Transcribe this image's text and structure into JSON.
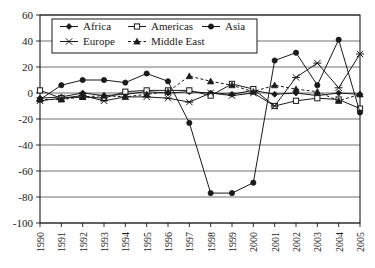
{
  "chart_data": {
    "type": "line",
    "title": "",
    "xlabel": "",
    "ylabel": "",
    "grid": true,
    "legend_position": "top-inside",
    "categories": [
      "1990",
      "1991",
      "1992",
      "1993",
      "1994",
      "1995",
      "1996",
      "1997",
      "1998",
      "1999",
      "2000",
      "2001",
      "2002",
      "2003",
      "2004",
      "2005"
    ],
    "x": [
      1990,
      1991,
      1992,
      1993,
      1994,
      1995,
      1996,
      1997,
      1998,
      1999,
      2000,
      2001,
      2002,
      2003,
      2004,
      2005
    ],
    "xlim": [
      1990,
      2005
    ],
    "ylim": [
      -100,
      60
    ],
    "yticks": [
      60,
      40,
      20,
      0,
      -20,
      -40,
      -60,
      -80,
      -100
    ],
    "series": [
      {
        "name": "Africa",
        "marker": "filled-diamond",
        "line": "solid",
        "color": "#1a1a1a",
        "values": [
          -4,
          -3,
          0,
          -2,
          -1,
          1,
          0,
          1,
          0,
          -1,
          2,
          -1,
          0,
          -2,
          0,
          -1
        ]
      },
      {
        "name": "Americas",
        "marker": "open-square",
        "line": "solid",
        "color": "#1a1a1a",
        "values": [
          2,
          -4,
          -3,
          -4,
          1,
          2,
          2,
          2,
          -2,
          7,
          3,
          -10,
          -6,
          -4,
          -5,
          -12
        ]
      },
      {
        "name": "Asia",
        "marker": "filled-circle",
        "line": "solid",
        "color": "#1a1a1a",
        "values": [
          -5,
          6,
          10,
          10,
          8,
          15,
          9,
          -23,
          -77,
          -77,
          -69,
          25,
          31,
          6,
          41,
          -15
        ]
      },
      {
        "name": "Europe",
        "marker": "cross-x",
        "line": "solid",
        "color": "#1a1a1a",
        "values": [
          -6,
          -4,
          -2,
          -6,
          -3,
          -3,
          -4,
          -7,
          0,
          -2,
          0,
          -10,
          12,
          23,
          4,
          30
        ]
      },
      {
        "name": "Middle East",
        "marker": "filled-triangle",
        "line": "dashed",
        "color": "#1a1a1a",
        "values": [
          -5,
          -5,
          -3,
          -2,
          -3,
          -1,
          1,
          13,
          9,
          6,
          1,
          6,
          3,
          1,
          -6,
          -1
        ]
      }
    ],
    "legend": [
      {
        "label": "Africa",
        "marker": "filled-diamond"
      },
      {
        "label": "Americas",
        "marker": "open-square"
      },
      {
        "label": "Asia",
        "marker": "filled-circle"
      },
      {
        "label": "Europe",
        "marker": "cross-x"
      },
      {
        "label": "Middle East",
        "marker": "filled-triangle"
      }
    ]
  }
}
